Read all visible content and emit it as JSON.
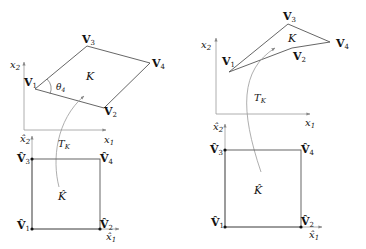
{
  "left_panel": {
    "element_label": "K",
    "angle_label": "θ",
    "angle_sub": "4",
    "map_label": "T",
    "map_sub": "K",
    "vertices": [
      {
        "name": "V",
        "sub": "1"
      },
      {
        "name": "V",
        "sub": "2"
      },
      {
        "name": "V",
        "sub": "3"
      },
      {
        "name": "V",
        "sub": "4"
      }
    ],
    "axes": {
      "x": "x",
      "x_sub": "1",
      "y": "x",
      "y_sub": "2"
    },
    "reference": {
      "element_label": "K̂",
      "vertices": [
        {
          "name": "V̂",
          "sub": "1"
        },
        {
          "name": "V̂",
          "sub": "2"
        },
        {
          "name": "V̂",
          "sub": "3"
        },
        {
          "name": "V̂",
          "sub": "4"
        }
      ],
      "axes": {
        "x": "x̂",
        "x_sub": "1",
        "y": "x̂",
        "y_sub": "2"
      }
    }
  },
  "right_panel": {
    "element_label": "K",
    "map_label": "T",
    "map_sub": "K",
    "vertices": [
      {
        "name": "V",
        "sub": "1"
      },
      {
        "name": "V",
        "sub": "2"
      },
      {
        "name": "V",
        "sub": "3"
      },
      {
        "name": "V",
        "sub": "4"
      }
    ],
    "axes": {
      "x": "x",
      "x_sub": "1",
      "y": "x",
      "y_sub": "2"
    },
    "reference": {
      "element_label": "K̂",
      "vertices": [
        {
          "name": "V̂",
          "sub": "1"
        },
        {
          "name": "V̂",
          "sub": "2"
        },
        {
          "name": "V̂",
          "sub": "3"
        },
        {
          "name": "V̂",
          "sub": "4"
        }
      ],
      "axes": {
        "x": "x̂",
        "x_sub": "1",
        "y": "x̂",
        "y_sub": "2"
      }
    }
  },
  "colors": {
    "line": "#555555",
    "axis": "#888888",
    "curve": "#999999",
    "text": "#111111"
  }
}
